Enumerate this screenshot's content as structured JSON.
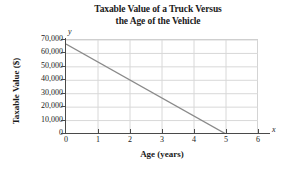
{
  "chart_data": {
    "type": "line",
    "title": "Taxable Value of a Truck Versus the Age of the Vehicle",
    "title_lines": [
      "Taxable Value of a Truck Versus",
      "the Age of the Vehicle"
    ],
    "xlabel": "Age (years)",
    "ylabel": "Taxable Value ($)",
    "x_axis_letter": "x",
    "y_axis_letter": "y",
    "xlim": [
      0,
      6
    ],
    "ylim": [
      0,
      70000
    ],
    "x_ticks": [
      0,
      1,
      2,
      3,
      4,
      5,
      6
    ],
    "x_tick_labels": [
      "0",
      "1",
      "2",
      "3",
      "4",
      "5",
      "6"
    ],
    "y_ticks": [
      0,
      10000,
      20000,
      30000,
      40000,
      50000,
      60000,
      70000
    ],
    "y_tick_labels": [
      "0",
      "10,000",
      "20,000",
      "30,000",
      "40,000",
      "50,000",
      "60,000",
      "70,000"
    ],
    "grid": true,
    "grid_color": "#d8d8d8",
    "legend": null,
    "line_color": "#8a8a8a",
    "axis_color": "#4a4a4a",
    "background_color": "#ffffff",
    "series": [
      {
        "name": "Taxable Value",
        "points": [
          {
            "x": 0,
            "y": 67000
          },
          {
            "x": 5,
            "y": 0
          }
        ],
        "x": [
          0,
          5
        ],
        "values": [
          67000,
          0
        ]
      }
    ]
  }
}
